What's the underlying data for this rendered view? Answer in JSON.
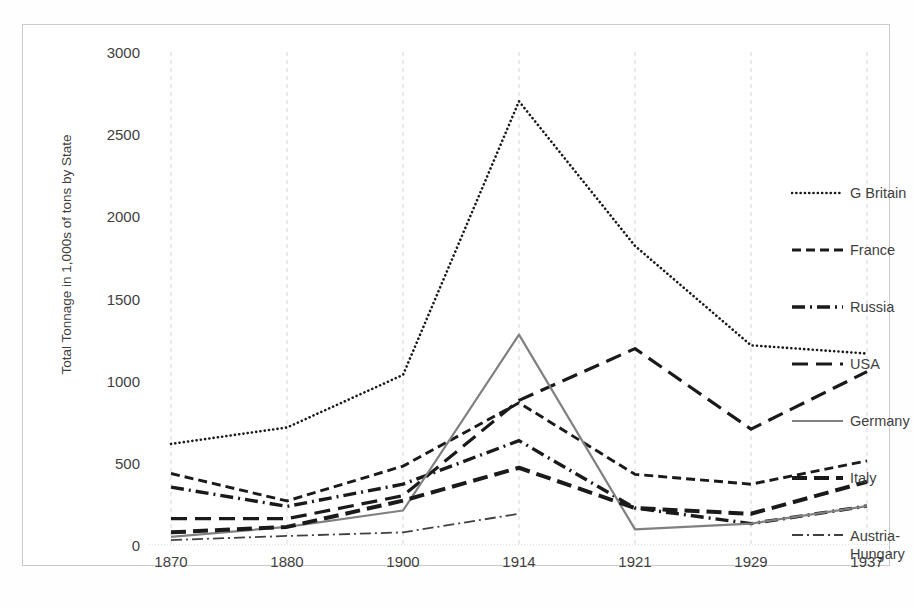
{
  "chart_data": {
    "type": "line",
    "title": "",
    "xlabel": "",
    "ylabel": "Total Tonnage in 1,000s of tons by State",
    "categories": [
      "1870",
      "1880",
      "1900",
      "1914",
      "1921",
      "1929",
      "1937"
    ],
    "ylim": [
      0,
      3000
    ],
    "yticks": [
      0,
      500,
      1000,
      1500,
      2000,
      2500,
      3000
    ],
    "ytick_labels": [
      "0",
      "500",
      "1000",
      "1500",
      "2000",
      "2500",
      "3000"
    ],
    "grid": "vertical-dashed",
    "legend_position": "right",
    "series": [
      {
        "name": "G Britain",
        "style": "dotted",
        "color": "#1a1a1a",
        "values": [
          615,
          715,
          1035,
          2700,
          1820,
          1215,
          1165
        ]
      },
      {
        "name": "France",
        "style": "dashed",
        "color": "#1a1a1a",
        "values": [
          435,
          268,
          480,
          865,
          430,
          370,
          512
        ]
      },
      {
        "name": "Russia",
        "style": "dash-dot",
        "color": "#1a1a1a",
        "values": [
          352,
          235,
          370,
          635,
          225,
          130,
          237
        ]
      },
      {
        "name": "USA",
        "style": "long-dash",
        "color": "#1a1a1a",
        "values": [
          160,
          160,
          300,
          880,
          1195,
          705,
          1055
        ]
      },
      {
        "name": "Germany",
        "style": "solid",
        "color": "#808080",
        "values": [
          50,
          110,
          210,
          1280,
          95,
          130,
          237
        ]
      },
      {
        "name": "Italy",
        "style": "thick-dash",
        "color": "#1a1a1a",
        "values": [
          77,
          110,
          270,
          470,
          225,
          190,
          385
        ]
      },
      {
        "name": "Austria-Hungary",
        "style": "thin-dash-dot",
        "color": "#404040",
        "values": [
          30,
          55,
          77,
          190,
          0,
          0,
          0
        ]
      }
    ]
  },
  "legend": {
    "items": [
      {
        "label": "G Britain"
      },
      {
        "label": "France"
      },
      {
        "label": "Russia"
      },
      {
        "label": "USA"
      },
      {
        "label": "Germany"
      },
      {
        "label": "Italy"
      },
      {
        "label": "Austria-Hungary"
      }
    ]
  }
}
